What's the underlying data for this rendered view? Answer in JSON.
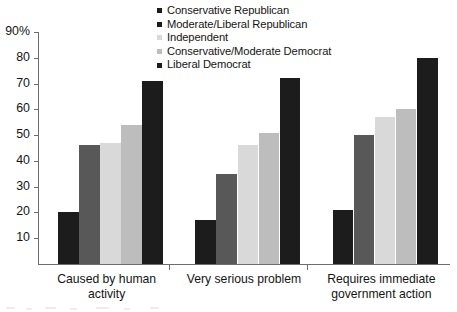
{
  "chart_data": {
    "type": "bar",
    "title": "",
    "subtitle": "",
    "xlabel": "",
    "ylabel": "",
    "ylim": [
      0,
      90
    ],
    "y_tick_values": [
      90,
      80,
      70,
      60,
      50,
      40,
      30,
      20,
      10
    ],
    "y_tick_labels": [
      "90%",
      "80",
      "70",
      "60",
      "50",
      "40",
      "30",
      "20",
      "10"
    ],
    "grid": false,
    "legend_position": "top-center",
    "categories": [
      "Caused by human activity",
      "Very serious problem",
      "Requires immediate\ngovernment action"
    ],
    "series": [
      {
        "name": "Conservative Republican",
        "color": "#1c1c1c",
        "values": [
          20,
          17,
          21
        ]
      },
      {
        "name": "Moderate/Liberal Republican",
        "color": "#585858",
        "values": [
          46,
          35,
          50
        ]
      },
      {
        "name": "Independent",
        "color": "#d9d9d9",
        "values": [
          47,
          46,
          57
        ]
      },
      {
        "name": "Conservative/Moderate Democrat",
        "color": "#bdbdbd",
        "values": [
          54,
          51,
          60
        ]
      },
      {
        "name": "Liberal Democrat",
        "color": "#1c1c1c",
        "values": [
          71,
          72,
          80
        ]
      }
    ]
  },
  "legend": {
    "items": [
      {
        "label": "Conservative Republican",
        "color": "#1c1c1c"
      },
      {
        "label": "Moderate/Liberal Republican",
        "color": "#1c1c1c"
      },
      {
        "label": "Independent",
        "color": "#d9d9d9"
      },
      {
        "label": "Conservative/Moderate Democrat",
        "color": "#bdbdbd"
      },
      {
        "label": "Liberal Democrat",
        "color": "#1c1c1c"
      }
    ]
  },
  "x_axis": {
    "groups": [
      {
        "line1": "Caused by human activity",
        "line2": ""
      },
      {
        "line1": "Very serious problem",
        "line2": ""
      },
      {
        "line1": "Requires immediate",
        "line2": "government action"
      }
    ]
  },
  "colors": {
    "axis": "#6d6d6d",
    "text": "#141414",
    "background": "#ffffff"
  }
}
